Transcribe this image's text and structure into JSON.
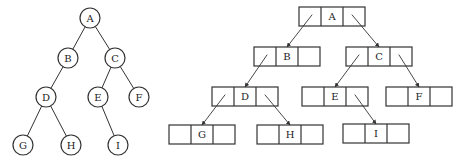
{
  "diagram": {
    "type": "binary-tree",
    "stroke_color": "#333333",
    "background": "#ffffff",
    "left_tree": {
      "style": "circle-nodes",
      "nodes": [
        {
          "id": "A",
          "label": "A",
          "cx": 90,
          "cy": 18
        },
        {
          "id": "B",
          "label": "B",
          "cx": 68,
          "cy": 58
        },
        {
          "id": "C",
          "label": "C",
          "cx": 115,
          "cy": 58
        },
        {
          "id": "D",
          "label": "D",
          "cx": 46,
          "cy": 97
        },
        {
          "id": "E",
          "label": "E",
          "cx": 98,
          "cy": 97
        },
        {
          "id": "F",
          "label": "F",
          "cx": 139,
          "cy": 97
        },
        {
          "id": "G",
          "label": "G",
          "cx": 23,
          "cy": 145
        },
        {
          "id": "H",
          "label": "H",
          "cx": 71,
          "cy": 145
        },
        {
          "id": "I",
          "label": "I",
          "cx": 118,
          "cy": 145
        }
      ],
      "edges": [
        [
          "A",
          "B"
        ],
        [
          "A",
          "C"
        ],
        [
          "B",
          "D"
        ],
        [
          "C",
          "E"
        ],
        [
          "C",
          "F"
        ],
        [
          "D",
          "G"
        ],
        [
          "D",
          "H"
        ],
        [
          "E",
          "I"
        ]
      ]
    },
    "right_tree": {
      "style": "linked-list-nodes (lchild | data | rchild)",
      "nodes": [
        {
          "id": "A",
          "label": "A",
          "x": 299,
          "y": 7
        },
        {
          "id": "B",
          "label": "B",
          "x": 254,
          "y": 47
        },
        {
          "id": "C",
          "label": "C",
          "x": 346,
          "y": 47
        },
        {
          "id": "D",
          "label": "D",
          "x": 212,
          "y": 87
        },
        {
          "id": "E",
          "label": "E",
          "x": 302,
          "y": 87
        },
        {
          "id": "F",
          "label": "F",
          "x": 386,
          "y": 87
        },
        {
          "id": "G",
          "label": "G",
          "x": 169,
          "y": 125
        },
        {
          "id": "H",
          "label": "H",
          "x": 257,
          "y": 125
        },
        {
          "id": "I",
          "label": "I",
          "x": 343,
          "y": 124
        }
      ],
      "pointers": [
        {
          "from": "A",
          "side": "left",
          "to": "B"
        },
        {
          "from": "A",
          "side": "right",
          "to": "C"
        },
        {
          "from": "B",
          "side": "left",
          "to": "D"
        },
        {
          "from": "C",
          "side": "left",
          "to": "E"
        },
        {
          "from": "C",
          "side": "right",
          "to": "F"
        },
        {
          "from": "D",
          "side": "left",
          "to": "G"
        },
        {
          "from": "D",
          "side": "right",
          "to": "H"
        },
        {
          "from": "E",
          "side": "right",
          "to": "I"
        }
      ]
    }
  }
}
